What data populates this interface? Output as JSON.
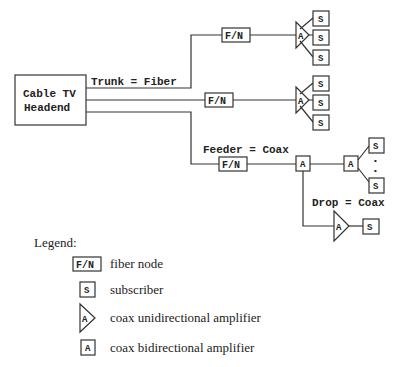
{
  "diagram": {
    "headend": {
      "line1": "Cable TV",
      "line2": "Headend"
    },
    "labels": {
      "trunk": "Trunk = Fiber",
      "feeder": "Feeder = Coax",
      "drop": "Drop = Coax"
    },
    "symbols": {
      "fiber_node": "F/N",
      "subscriber": "S",
      "amplifier": "A",
      "ellipsis": "•"
    }
  },
  "legend": {
    "title": "Legend:",
    "items": [
      {
        "symbol": "F/N",
        "label": "fiber node"
      },
      {
        "symbol": "S",
        "label": "subscriber"
      },
      {
        "symbol": "A",
        "label": "coax unidirectional amplifier"
      },
      {
        "symbol": "A",
        "label": "coax bidirectional amplifier"
      }
    ]
  }
}
